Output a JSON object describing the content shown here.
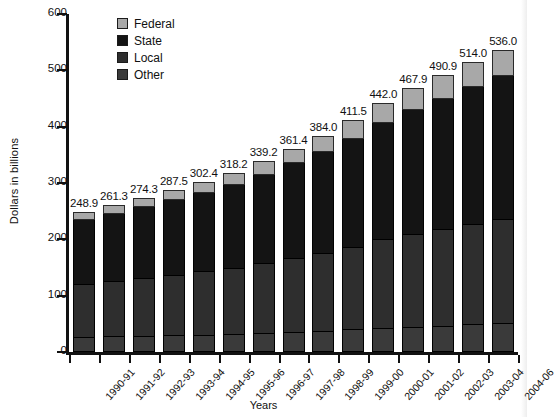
{
  "chart_data": {
    "type": "bar",
    "subtype": "stacked-bar",
    "title": "",
    "xlabel": "Years",
    "ylabel": "Dollars in billions",
    "ylim": [
      0,
      600
    ],
    "yticks": [
      0,
      100,
      200,
      300,
      400,
      500,
      600
    ],
    "ytick_labels": [
      "0",
      "100",
      "200",
      "300",
      "400",
      "500",
      "600"
    ],
    "grid": false,
    "legend_position": "top-left-inside",
    "legend": [
      "Federal",
      "State",
      "Local",
      "Other"
    ],
    "categories": [
      "1990-91",
      "1991-92",
      "1992-93",
      "1993-94",
      "1994-95",
      "1995-96",
      "1996-97",
      "1997-98",
      "1998-99",
      "1999-00",
      "2000-01",
      "2001-02",
      "2002-03",
      "2003-04",
      "2004-06"
    ],
    "totals": [
      248.9,
      261.3,
      274.3,
      287.5,
      302.4,
      318.2,
      339.2,
      361.4,
      384.0,
      411.5,
      442.0,
      467.9,
      490.9,
      514.0,
      536.0
    ],
    "total_labels": [
      "248.9",
      "261.3",
      "274.3",
      "287.5",
      "302.4",
      "318.2",
      "339.2",
      "361.4",
      "384.0",
      "411.5",
      "442.0",
      "467.9",
      "490.9",
      "514.0",
      "536.0"
    ],
    "series": [
      {
        "name": "Other",
        "color": "#3a3a3a",
        "values": [
          27,
          28,
          29,
          30,
          31,
          32,
          34,
          36,
          38,
          40,
          43,
          45,
          47,
          49,
          51
        ]
      },
      {
        "name": "Local",
        "color": "#2e2e2e",
        "values": [
          94,
          98,
          103,
          107,
          112,
          117,
          124,
          131,
          138,
          147,
          157,
          165,
          172,
          179,
          186
        ]
      },
      {
        "name": "State",
        "color": "#141414",
        "values": [
          113,
          119,
          125,
          132,
          139,
          147,
          157,
          168,
          179,
          192,
          206,
          219,
          230,
          242,
          253
        ]
      },
      {
        "name": "Federal",
        "color": "#a8a8a8",
        "values": [
          15,
          16,
          17,
          19,
          20,
          22,
          24,
          26,
          29,
          33,
          36,
          39,
          42,
          44,
          46
        ]
      }
    ]
  },
  "legend": {
    "items": [
      {
        "label": "Federal",
        "color": "#a8a8a8"
      },
      {
        "label": "State",
        "color": "#141414"
      },
      {
        "label": "Local",
        "color": "#2e2e2e"
      },
      {
        "label": "Other",
        "color": "#3a3a3a"
      }
    ]
  },
  "axes": {
    "y_title": "Dollars in billions",
    "x_title": "Years"
  }
}
